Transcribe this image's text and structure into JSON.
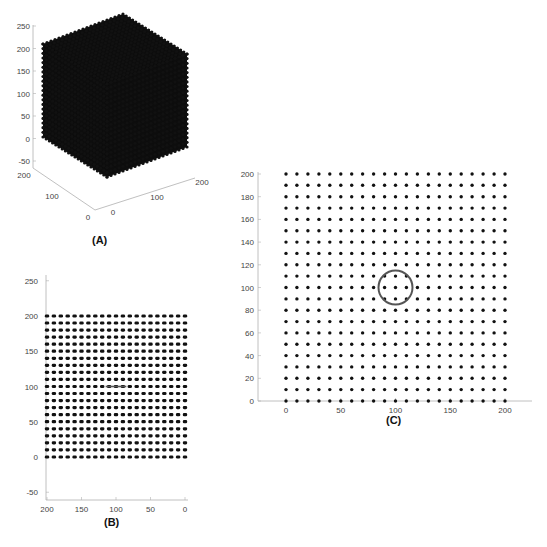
{
  "figure": {
    "captions": {
      "a": "(A)",
      "b": "(B)",
      "c": "(C)"
    },
    "colors": {
      "dot": "#111111",
      "axis": "#b0b0b0",
      "marker": "#555555",
      "text": "#444444"
    }
  },
  "chart_data": [
    {
      "id": "A",
      "type": "scatter",
      "projection": "3d",
      "title": "",
      "description": "3D cubic lattice of points, 21 x 21 x 21 grid spanning 0-200 on each axis at spacing 10",
      "grid_points_per_axis": 21,
      "spacing": 10,
      "x_range": [
        0,
        200
      ],
      "y_range": [
        0,
        200
      ],
      "z_range": [
        0,
        200
      ],
      "z_ticks": [
        -50,
        0,
        50,
        100,
        150,
        200,
        250
      ],
      "x_ticks": [
        0,
        100,
        200
      ],
      "y_ticks": [
        0,
        100,
        200
      ],
      "zlim": [
        -50,
        250
      ]
    },
    {
      "id": "B",
      "type": "scatter",
      "title": "",
      "description": "Side view of lattice: rows of points from 0 to 200, with a horizontal line marker near (100,100)",
      "x": [
        0,
        10,
        20,
        30,
        40,
        50,
        60,
        70,
        80,
        90,
        100,
        110,
        120,
        130,
        140,
        150,
        160,
        170,
        180,
        190,
        200
      ],
      "y": [
        0,
        10,
        20,
        30,
        40,
        50,
        60,
        70,
        80,
        90,
        100,
        110,
        120,
        130,
        140,
        150,
        160,
        170,
        180,
        190,
        200
      ],
      "x_ticks": [
        200,
        150,
        100,
        50,
        0
      ],
      "y_ticks": [
        -50,
        0,
        50,
        100,
        150,
        200,
        250
      ],
      "xlim": [
        200,
        0
      ],
      "ylim": [
        -60,
        260
      ],
      "x_reversed": true,
      "annotation": {
        "type": "line",
        "x_from": 85,
        "x_to": 115,
        "y": 100
      }
    },
    {
      "id": "C",
      "type": "scatter",
      "title": "",
      "description": "Top view of lattice: 21 x 21 grid of points from 0 to 200, with circle marker centered at (100,100)",
      "x": [
        0,
        10,
        20,
        30,
        40,
        50,
        60,
        70,
        80,
        90,
        100,
        110,
        120,
        130,
        140,
        150,
        160,
        170,
        180,
        190,
        200
      ],
      "y": [
        0,
        10,
        20,
        30,
        40,
        50,
        60,
        70,
        80,
        90,
        100,
        110,
        120,
        130,
        140,
        150,
        160,
        170,
        180,
        190,
        200
      ],
      "x_ticks": [
        0,
        50,
        100,
        150,
        200
      ],
      "y_ticks": [
        0,
        20,
        40,
        60,
        80,
        100,
        120,
        140,
        160,
        180,
        200
      ],
      "xlim": [
        -25,
        225
      ],
      "ylim": [
        0,
        200
      ],
      "annotation": {
        "type": "circle",
        "cx": 100,
        "cy": 100,
        "r": 15
      }
    }
  ]
}
